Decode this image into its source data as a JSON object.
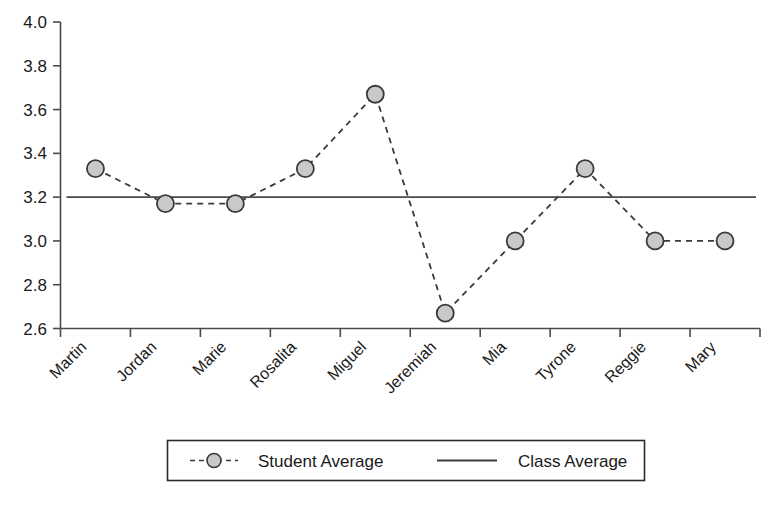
{
  "chart_data": {
    "type": "line",
    "title": "",
    "xlabel": "",
    "ylabel": "",
    "ylim": [
      2.6,
      4.0
    ],
    "ytick_values": [
      2.6,
      2.8,
      3.0,
      3.2,
      3.4,
      3.6,
      3.8,
      4.0
    ],
    "ytick_labels": [
      "2.6",
      "2.8",
      "3.0",
      "3.2",
      "3.4",
      "3.6",
      "3.8",
      "4.0"
    ],
    "grid": false,
    "legend_position": "bottom",
    "categories": [
      "Martin",
      "Jordan",
      "Marie",
      "Rosalita",
      "Miguel",
      "Jeremiah",
      "Mia",
      "Tyrone",
      "Reggie",
      "Mary"
    ],
    "series": [
      {
        "name": "Student Average",
        "style": "dashed-with-markers",
        "marker": "circle",
        "marker_fill": "#c9c9c9",
        "marker_stroke": "#3a3a3a",
        "line_color": "#3a3a3a",
        "values": [
          3.33,
          3.17,
          3.17,
          3.33,
          3.67,
          2.67,
          3.0,
          3.33,
          3.0,
          3.0
        ]
      },
      {
        "name": "Class Average",
        "style": "solid",
        "line_color": "#4a4a4a",
        "constant_value": 3.2,
        "values": [
          3.2,
          3.2,
          3.2,
          3.2,
          3.2,
          3.2,
          3.2,
          3.2,
          3.2,
          3.2
        ]
      }
    ]
  },
  "legend": {
    "items": [
      {
        "label": "Student Average"
      },
      {
        "label": "Class Average"
      }
    ]
  },
  "axis": {
    "y_labels": [
      "4.0",
      "3.8",
      "3.6",
      "3.4",
      "3.2",
      "3.0",
      "2.8",
      "2.6"
    ],
    "x_labels": [
      "Martin",
      "Jordan",
      "Marie",
      "Rosalita",
      "Miguel",
      "Jeremiah",
      "Mia",
      "Tyrone",
      "Reggie",
      "Mary"
    ]
  },
  "colors": {
    "axis": "#4a4a4a",
    "marker_fill": "#c9c9c9",
    "marker_stroke": "#3a3a3a",
    "series_line": "#3a3a3a",
    "class_line": "#4a4a4a",
    "text": "#1a1a1a"
  }
}
